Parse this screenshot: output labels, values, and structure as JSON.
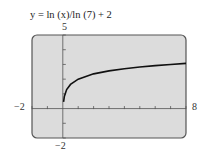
{
  "chart_data": {
    "type": "line",
    "title": "y = ln (x)/ln (7) + 2",
    "xlabel": "",
    "ylabel": "",
    "xlim": [
      -2,
      8
    ],
    "ylim": [
      -2,
      5
    ],
    "grid": false,
    "legend": null,
    "tick_labels": {
      "x_min": "−2",
      "x_max": "8",
      "y_max": "5",
      "y_min": "−2"
    },
    "series": [
      {
        "name": "y = ln(x)/ln(7) + 2",
        "x": [
          0.05,
          0.1,
          0.25,
          0.5,
          1,
          2,
          3,
          4,
          5,
          6,
          7,
          8
        ],
        "y": [
          0.46,
          0.82,
          1.29,
          1.64,
          2.0,
          2.36,
          2.56,
          2.71,
          2.83,
          2.92,
          3.0,
          3.07
        ]
      }
    ]
  },
  "colors": {
    "plot_background": "#dcdcdc",
    "frame": "#555555",
    "curve": "#111111"
  }
}
